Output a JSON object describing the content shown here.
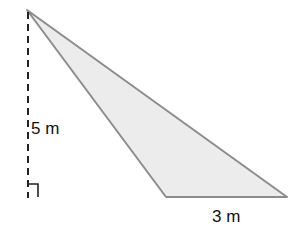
{
  "diagram": {
    "type": "triangle-with-height",
    "colors": {
      "fill": "#ececec",
      "stroke": "#8c8c8c",
      "height_line": "#222222",
      "text": "#111111"
    },
    "vertices": {
      "apex": [
        27,
        10
      ],
      "base_left": [
        166,
        197
      ],
      "base_right": [
        287,
        197
      ]
    },
    "height_label": "5 m",
    "base_label": "3 m",
    "right_angle_marker": true
  }
}
